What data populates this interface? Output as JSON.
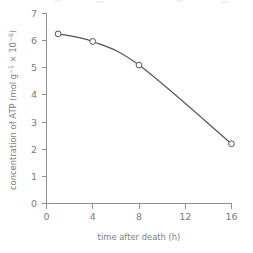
{
  "chart_data": {
    "type": "line",
    "title": "",
    "xlabel": "time after death (h)",
    "ylabel": "concentration of ATP (mol g⁻¹ × 10⁻⁶)",
    "ylabel_parts": {
      "lead": "concentration of ATP (mol g",
      "sup1": "−1",
      "mid": " × 10",
      "sup2": "−6",
      "tail": ")"
    },
    "x": [
      1,
      4,
      8,
      16
    ],
    "values": [
      6.25,
      5.97,
      5.1,
      2.2
    ],
    "series": [
      {
        "name": "ATP concentration",
        "points": [
          {
            "x": 1,
            "y": 6.25
          },
          {
            "x": 4,
            "y": 5.97
          },
          {
            "x": 8,
            "y": 5.1
          },
          {
            "x": 16,
            "y": 2.2
          }
        ]
      }
    ],
    "xlim": [
      0,
      16
    ],
    "ylim": [
      0,
      7
    ],
    "xticks": [
      0,
      4,
      8,
      12,
      16
    ],
    "yticks": [
      0,
      1,
      2,
      3,
      4,
      5,
      6,
      7
    ],
    "xtick_labels": [
      "0",
      "4",
      "8",
      "12",
      "16"
    ],
    "ytick_labels": [
      "0",
      "1",
      "2",
      "3",
      "4",
      "5",
      "6",
      "7"
    ],
    "grid": false,
    "legend": false,
    "legend_position": "none",
    "marker": "open-circle",
    "line_style": "solid"
  },
  "colors": {
    "axis": "#8f8f8f",
    "line": "#555555",
    "marker_fill": "#ffffff",
    "text": "#7d7d7d",
    "background": "#ffffff"
  }
}
